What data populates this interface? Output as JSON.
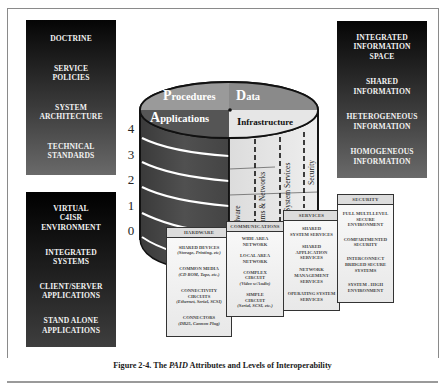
{
  "left_top_box": {
    "items": [
      "DOCTRINE",
      "SERVICE\nPOLICIES",
      "SYSTEM\nARCHITECTURE",
      "TECHNICAL\nSTANDARDS"
    ]
  },
  "left_bottom_box": {
    "items": [
      "VIRTUAL\nC4ISR\nENVIRONMENT",
      "INTEGRATED\nSYSTEMS",
      "CLIENT/SERVER\nAPPLICATIONS",
      "STAND ALONE\nAPPLICATIONS"
    ]
  },
  "right_top_box": {
    "items": [
      "INTEGRATED\nINFORMATION\nSPACE",
      "SHARED\nINFORMATION",
      "HETEROGENEOUS\nINFORMATION",
      "HOMOGENEOUS\nINFORMATION"
    ]
  },
  "levels": [
    "4",
    "3",
    "2",
    "1",
    "0"
  ],
  "cylinder": {
    "quadrants": {
      "procedures": {
        "initial": "P",
        "rest": "rocedures"
      },
      "data": {
        "initial": "D",
        "rest": "ata"
      },
      "applications": {
        "initial": "A",
        "rest": "pplications"
      },
      "infrastructure": {
        "initial": "I",
        "rest": "nfrastructure"
      }
    },
    "columns": [
      "Hardware",
      "Comms & Networks",
      "System Services",
      "Security"
    ],
    "colors": {
      "top": "#8a8a8a",
      "side_dark": "#4a4a4a",
      "side_light": "#e2e2e2",
      "ring": "#ffffff"
    }
  },
  "detail_boxes": {
    "hardware": {
      "header": "HARDWARE",
      "entries": [
        {
          "title": "SHARED DEVICES",
          "sub": "(Storage, Printing, etc)"
        },
        {
          "title": "COMMON MEDIA",
          "sub": "(CD ROM, Tape, etc.)"
        },
        {
          "title": "CONNECTIVITY\nCIRCUITS",
          "sub": "(Ethernet, Serial, SCSI)"
        },
        {
          "title": "CONNECTORS",
          "sub": "(DB25, Cannon Plug)"
        }
      ]
    },
    "communications": {
      "header": "COMMUNICATIONS",
      "entries": [
        {
          "title": "WIDE AREA\nNETWORK",
          "sub": ""
        },
        {
          "title": "LOCAL AREA\nNETWORK",
          "sub": ""
        },
        {
          "title": "COMPLEX\nCIRCUIT",
          "sub": "(Video w/Audio)"
        },
        {
          "title": "SIMPLE\nCIRCUIT",
          "sub": "(Serial, SCSI, etc.)"
        }
      ]
    },
    "services": {
      "header": "SERVICES",
      "entries": [
        {
          "title": "SHARED\nSYSTEM SERVICES",
          "sub": ""
        },
        {
          "title": "SHARED\nAPPLICATION\nSERVICES",
          "sub": ""
        },
        {
          "title": "NETWORK\nMANAGEMENT\nSERVICES",
          "sub": ""
        },
        {
          "title": "OPERATING SYSTEM\nSERVICES",
          "sub": ""
        }
      ]
    },
    "security": {
      "header": "SECURITY",
      "entries": [
        {
          "title": "FULL MULTI-LEVEL\nSECURE\nENVIRONMENT",
          "sub": ""
        },
        {
          "title": "COMPARTMENTED\nSECURITY",
          "sub": ""
        },
        {
          "title": "INTERCONNECT\nBRIDGED SECURE\nSYSTEMS",
          "sub": ""
        },
        {
          "title": "SYSTEM - HIGH\nENVIRONMENT",
          "sub": ""
        }
      ]
    }
  },
  "caption": {
    "prefix": "Figure 2-4.  The ",
    "emphasis": "PAID",
    "suffix": " Attributes and Levels of Interoperability"
  }
}
